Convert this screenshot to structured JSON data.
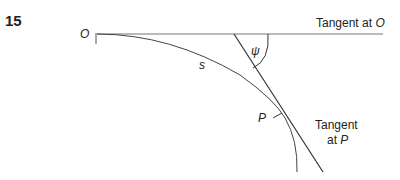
{
  "figure": {
    "number": "15",
    "labels": {
      "origin": "O",
      "arc_length": "s",
      "angle": "ψ",
      "point": "P",
      "tangent_o_text": "Tangent at ",
      "tangent_o_var": "O",
      "tangent_p_line1": "Tangent",
      "tangent_p_line2_text": "at ",
      "tangent_p_line2_var": "P"
    }
  }
}
